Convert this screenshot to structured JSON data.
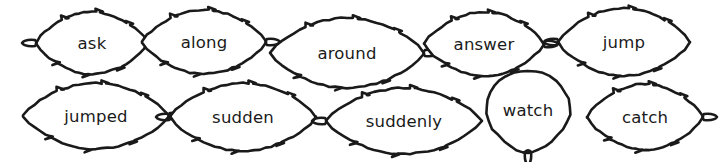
{
  "worksheet": {
    "title": "Leaf Sight Word Cards",
    "background_color": "#ffffff",
    "ink_color": "#1a1a1a",
    "rows": 2,
    "columns": 5,
    "total_leaves": 10
  },
  "leaves": [
    {
      "id": "leaf-ask",
      "word": "ask",
      "row": 1,
      "column": 1,
      "shape": "leaf-pointed-right",
      "stem_side": "left",
      "cx": 92,
      "cy": 43,
      "rx": 56,
      "ry": 31,
      "font_size": 17
    },
    {
      "id": "leaf-along",
      "word": "along",
      "row": 1,
      "column": 2,
      "shape": "leaf-pointed-left",
      "stem_side": "right",
      "cx": 204,
      "cy": 42,
      "rx": 62,
      "ry": 32,
      "font_size": 17
    },
    {
      "id": "leaf-around",
      "word": "around",
      "row": 1,
      "column": 3,
      "shape": "leaf-pointed-left",
      "stem_side": "right",
      "cx": 347,
      "cy": 53,
      "rx": 77,
      "ry": 35,
      "font_size": 17
    },
    {
      "id": "leaf-answer",
      "word": "answer",
      "row": 1,
      "column": 4,
      "shape": "leaf-pointed-left",
      "stem_side": "right",
      "cx": 484,
      "cy": 44,
      "rx": 60,
      "ry": 32,
      "font_size": 17
    },
    {
      "id": "leaf-jump",
      "word": "jump",
      "row": 1,
      "column": 5,
      "shape": "leaf-pointed-right",
      "stem_side": "left",
      "cx": 624,
      "cy": 42,
      "rx": 66,
      "ry": 34,
      "font_size": 17
    },
    {
      "id": "leaf-jumped",
      "word": "jumped",
      "row": 2,
      "column": 1,
      "shape": "leaf-pointed-left",
      "stem_side": "right",
      "cx": 96,
      "cy": 116,
      "rx": 73,
      "ry": 33,
      "font_size": 17
    },
    {
      "id": "leaf-sudden",
      "word": "sudden",
      "row": 2,
      "column": 2,
      "shape": "leaf-pointed-right",
      "stem_side": "left",
      "cx": 243,
      "cy": 117,
      "rx": 73,
      "ry": 34,
      "font_size": 17
    },
    {
      "id": "leaf-suddenly",
      "word": "suddenly",
      "row": 2,
      "column": 3,
      "shape": "leaf-pointed-right",
      "stem_side": "left",
      "cx": 404,
      "cy": 121,
      "rx": 78,
      "ry": 33,
      "font_size": 17
    },
    {
      "id": "leaf-watch",
      "word": "watch",
      "row": 2,
      "column": 4,
      "shape": "leaf-heart-round",
      "stem_side": "bottom",
      "cx": 528,
      "cy": 110,
      "rx": 42,
      "ry": 41,
      "font_size": 17
    },
    {
      "id": "leaf-catch",
      "word": "catch",
      "row": 2,
      "column": 5,
      "shape": "leaf-pointed-left",
      "stem_side": "right",
      "cx": 645,
      "cy": 117,
      "rx": 58,
      "ry": 33,
      "font_size": 17
    }
  ]
}
